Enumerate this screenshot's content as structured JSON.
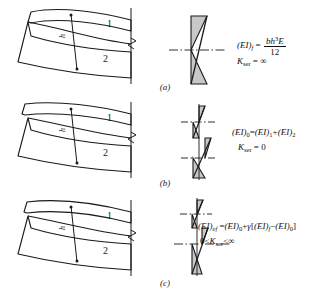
{
  "figure": {
    "colors": {
      "stroke": "#1a1a1a",
      "fill": "#c8c8c8",
      "background": "#ffffff"
    }
  },
  "panels": [
    {
      "id": "a",
      "caption": "(a)",
      "beam": {
        "layer_labels": [
          "1",
          "2"
        ],
        "depth_label": "h"
      },
      "stress_diagram": {
        "type": "full-composite-linear",
        "description": "single continuous linear strain distribution across full depth"
      },
      "formula": {
        "line1_lhs": "(EI)",
        "line1_lhs_sub": "f",
        "line1_eq": " = ",
        "numerator": "bh",
        "numerator_sup": "3",
        "numerator_tail": "E",
        "denominator": "12",
        "line2_lhs": "K",
        "line2_lhs_sub": "ser",
        "line2_eq": " = ",
        "line2_rhs": "∞"
      }
    },
    {
      "id": "b",
      "caption": "(b)",
      "beam": {
        "layer_labels": [
          "1",
          "2"
        ],
        "depth_label": "h"
      },
      "stress_diagram": {
        "type": "no-composite-sawtooth",
        "description": "two independent linear strain blocks, discontinuous at interface"
      },
      "formula": {
        "line1": "(EI)₀=(EI)₁+(EI)₂",
        "line1_parts": {
          "lhs": "(EI)",
          "lhs_sub": "0",
          "rhs1": "(EI)",
          "rhs1_sub": "1",
          "rhs2": "(EI)",
          "rhs2_sub": "2"
        },
        "line2_lhs": "K",
        "line2_lhs_sub": "ser",
        "line2_eq": " = ",
        "line2_rhs": "0"
      }
    },
    {
      "id": "c",
      "caption": "(c)",
      "beam": {
        "layer_labels": [
          "1",
          "2"
        ],
        "depth_label": "h"
      },
      "stress_diagram": {
        "type": "partial-composite-sawtooth",
        "description": "partial interaction, reduced slip discontinuity at interface"
      },
      "formula": {
        "line1_parts": {
          "lhs": "(EI)",
          "lhs_sub": "ef",
          "eq": " = ",
          "t0": "(EI)",
          "t0_sub": "0",
          "plus": "+",
          "gamma": "γ",
          "bracket_open": "[",
          "t1": "(EI)",
          "t1_sub": "f",
          "minus": "−",
          "t2": "(EI)",
          "t2_sub": "0",
          "bracket_close": "]"
        },
        "line2": "0 < K",
        "line2_sub": "ser",
        "line2_tail": " < ∞"
      }
    }
  ]
}
